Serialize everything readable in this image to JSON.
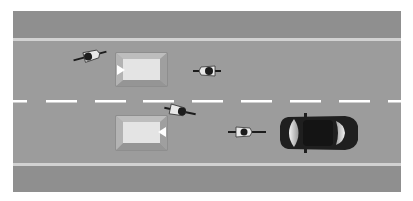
{
  "diagram": {
    "type": "road-overtaking-scene",
    "colors": {
      "background": "#ffffff",
      "sidewalk": "#8f8f8f",
      "road": "#9c9c9c",
      "curb_line": "#d2d2d2",
      "lane_marking": "#ffffff",
      "island_outer": "#a9a9a9",
      "island_inner": "#e4e4e4",
      "car_body": "#1f1f1f",
      "car_glass": "#d9d9d9",
      "cyclist": "#1c1c1c",
      "cyclist_bike": "#e8e8e8"
    },
    "objects": [
      {
        "kind": "traffic-island",
        "lane": "upper",
        "arrow": "left"
      },
      {
        "kind": "traffic-island",
        "lane": "lower",
        "arrow": "right"
      },
      {
        "kind": "cyclist",
        "lane": "upper",
        "heading": "right",
        "position": "left"
      },
      {
        "kind": "cyclist",
        "lane": "upper",
        "heading": "left",
        "position": "center"
      },
      {
        "kind": "cyclist",
        "lane": "center",
        "heading": "right",
        "position": "center"
      },
      {
        "kind": "cyclist",
        "lane": "lower",
        "heading": "left",
        "position": "right"
      },
      {
        "kind": "car",
        "lane": "lower",
        "heading": "left",
        "position": "right"
      }
    ]
  }
}
